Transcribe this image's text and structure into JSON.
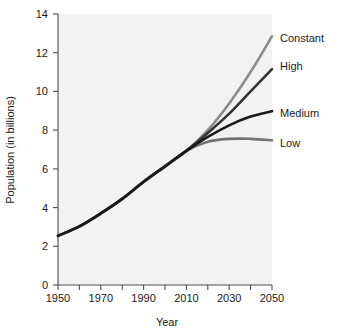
{
  "chart_data": {
    "type": "line",
    "title": "",
    "xlabel": "Year",
    "ylabel": "Population (in billions)",
    "xlim": [
      1950,
      2050
    ],
    "ylim": [
      0,
      14
    ],
    "xticks": [
      1950,
      1960,
      1970,
      1980,
      1990,
      2000,
      2010,
      2020,
      2030,
      2040,
      2050
    ],
    "xtick_labels": [
      "1950",
      "",
      "1970",
      "",
      "1990",
      "",
      "2010",
      "",
      "2030",
      "",
      "2050"
    ],
    "yticks": [
      0,
      2,
      4,
      6,
      8,
      10,
      12,
      14
    ],
    "ytick_labels": [
      "0",
      "2",
      "4",
      "6",
      "8",
      "10",
      "12",
      "14"
    ],
    "grid": false,
    "legend_position": "right-of-line-ends",
    "x": [
      1950,
      1960,
      1970,
      1980,
      1990,
      2000,
      2010,
      2020,
      2030,
      2040,
      2050
    ],
    "series": [
      {
        "name": "Constant",
        "label": "Constant",
        "color": "#8c8c8c",
        "values": [
          2.54,
          3.03,
          3.7,
          4.45,
          5.33,
          6.13,
          6.93,
          8.0,
          9.38,
          11.0,
          12.85
        ]
      },
      {
        "name": "High",
        "label": "High",
        "color": "#333333",
        "values": [
          2.54,
          3.03,
          3.7,
          4.45,
          5.33,
          6.13,
          6.93,
          7.85,
          8.85,
          10.0,
          11.15
        ]
      },
      {
        "name": "Medium",
        "label": "Medium",
        "color": "#1a1a1a",
        "values": [
          2.54,
          3.03,
          3.7,
          4.45,
          5.33,
          6.13,
          6.93,
          7.65,
          8.25,
          8.7,
          8.98
        ]
      },
      {
        "name": "Low",
        "label": "Low",
        "color": "#737373",
        "values": [
          2.54,
          3.03,
          3.7,
          4.45,
          5.33,
          6.13,
          6.93,
          7.4,
          7.55,
          7.55,
          7.48
        ]
      }
    ]
  },
  "labels": {
    "constant": "Constant",
    "high": "High",
    "medium": "Medium",
    "low": "Low",
    "x_axis_title": "Year",
    "y_axis_title": "Population (in billions)",
    "y_0": "0",
    "y_2": "2",
    "y_4": "4",
    "y_6": "6",
    "y_8": "8",
    "y_10": "10",
    "y_12": "12",
    "y_14": "14",
    "x_1950": "1950",
    "x_1970": "1970",
    "x_1990": "1990",
    "x_2010": "2010",
    "x_2030": "2030",
    "x_2050": "2050"
  }
}
